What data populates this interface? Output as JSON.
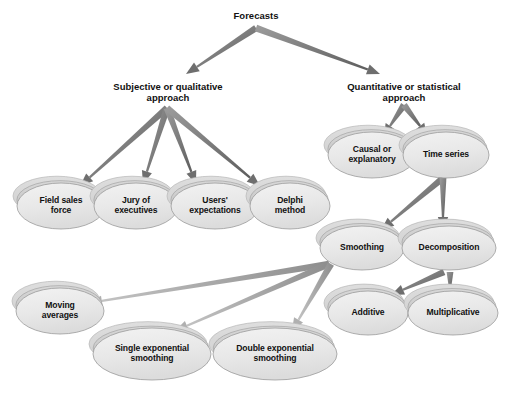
{
  "diagram": {
    "background_color": "#ffffff",
    "palette": {
      "ellipse_face": "#e6e6e6",
      "ellipse_face_edge": "#9a9a9a",
      "ellipse_top_shadow": "#c9c9c9",
      "ellipse_back_shadow": "#d4d4d4",
      "ellipse_dark_wedge": "#8c8c8c",
      "arrow_dark": "#6e6e6e",
      "arrow_light": "#b0b0b0",
      "text_color": "#111111"
    },
    "plain_nodes": [
      {
        "id": "forecasts",
        "label": "Forecasts",
        "cx": 256,
        "cy": 17,
        "font_size": 9.5
      },
      {
        "id": "subjective",
        "label": "Subjective or qualitative\napproach",
        "cx": 168,
        "cy": 88,
        "font_size": 9.5
      },
      {
        "id": "quantitative",
        "label": "Quantitative or statistical\napproach",
        "cx": 404,
        "cy": 88,
        "font_size": 9.5
      }
    ],
    "ellipse_nodes": [
      {
        "id": "field-sales-force",
        "label": "Field sales\nforce",
        "cx": 61,
        "cy": 206,
        "rx": 44,
        "ry": 23,
        "font_size": 8.6
      },
      {
        "id": "jury-of-executives",
        "label": "Jury of\nexecutives",
        "cx": 136,
        "cy": 206,
        "rx": 42,
        "ry": 23,
        "font_size": 8.6
      },
      {
        "id": "users-expectations",
        "label": "Users'\nexpectations",
        "cx": 215,
        "cy": 206,
        "rx": 44,
        "ry": 23,
        "font_size": 8.6
      },
      {
        "id": "delphi-method",
        "label": "Delphi\nmethod",
        "cx": 290,
        "cy": 206,
        "rx": 40,
        "ry": 23,
        "font_size": 8.6
      },
      {
        "id": "causal-or-explanatory",
        "label": "Causal or\nexplanatory",
        "cx": 372,
        "cy": 155,
        "rx": 44,
        "ry": 23,
        "font_size": 8.6
      },
      {
        "id": "time-series",
        "label": "Time series",
        "cx": 446,
        "cy": 155,
        "rx": 43,
        "ry": 23,
        "font_size": 8.6
      },
      {
        "id": "smoothing",
        "label": "Smoothing",
        "cx": 362,
        "cy": 248,
        "rx": 42,
        "ry": 22,
        "font_size": 8.6
      },
      {
        "id": "decomposition",
        "label": "Decomposition",
        "cx": 449,
        "cy": 248,
        "rx": 47,
        "ry": 22,
        "font_size": 8.6
      },
      {
        "id": "additive",
        "label": "Additive",
        "cx": 368,
        "cy": 313,
        "rx": 40,
        "ry": 22,
        "font_size": 8.6
      },
      {
        "id": "multiplicative",
        "label": "Multiplicative",
        "cx": 453,
        "cy": 313,
        "rx": 45,
        "ry": 22,
        "font_size": 8.6
      },
      {
        "id": "moving-averages",
        "label": "Moving\naverages",
        "cx": 60,
        "cy": 311,
        "rx": 44,
        "ry": 23,
        "font_size": 8.6
      },
      {
        "id": "single-exponential-smoothing",
        "label": "Single exponential\nsmoothing",
        "cx": 152,
        "cy": 354,
        "rx": 59,
        "ry": 26,
        "font_size": 8.6
      },
      {
        "id": "double-exponential-smoothing",
        "label": "Double exponential\nsmoothing",
        "cx": 275,
        "cy": 354,
        "rx": 62,
        "ry": 26,
        "font_size": 8.6
      }
    ],
    "edges": [
      {
        "from": "forecasts",
        "to": "subjective",
        "x1": 256,
        "y1": 28,
        "x2": 186,
        "y2": 74,
        "style": "dark"
      },
      {
        "from": "forecasts",
        "to": "quantitative",
        "x1": 256,
        "y1": 28,
        "x2": 380,
        "y2": 74,
        "style": "dark"
      },
      {
        "from": "subjective",
        "to": "field-sales-force",
        "x1": 167,
        "y1": 108,
        "x2": 80,
        "y2": 186,
        "style": "dark"
      },
      {
        "from": "subjective",
        "to": "jury-of-executives",
        "x1": 167,
        "y1": 108,
        "x2": 143,
        "y2": 184,
        "style": "dark"
      },
      {
        "from": "subjective",
        "to": "users-expectations",
        "x1": 167,
        "y1": 108,
        "x2": 196,
        "y2": 184,
        "style": "dark"
      },
      {
        "from": "subjective",
        "to": "delphi-method",
        "x1": 167,
        "y1": 108,
        "x2": 260,
        "y2": 186,
        "style": "dark"
      },
      {
        "from": "quantitative",
        "to": "causal-or-explanatory",
        "x1": 404,
        "y1": 105,
        "x2": 384,
        "y2": 135,
        "style": "dark"
      },
      {
        "from": "quantitative",
        "to": "time-series",
        "x1": 404,
        "y1": 105,
        "x2": 427,
        "y2": 135,
        "style": "dark"
      },
      {
        "from": "time-series",
        "to": "smoothing",
        "x1": 443,
        "y1": 178,
        "x2": 381,
        "y2": 230,
        "style": "dark"
      },
      {
        "from": "time-series",
        "to": "decomposition",
        "x1": 443,
        "y1": 178,
        "x2": 443,
        "y2": 230,
        "style": "dark"
      },
      {
        "from": "decomposition",
        "to": "additive",
        "x1": 444,
        "y1": 272,
        "x2": 391,
        "y2": 295,
        "style": "dark"
      },
      {
        "from": "decomposition",
        "to": "multiplicative",
        "x1": 450,
        "y1": 272,
        "x2": 450,
        "y2": 295,
        "style": "dark"
      },
      {
        "from": "smoothing",
        "to": "moving-averages",
        "x1": 329,
        "y1": 264,
        "x2": 89,
        "y2": 303,
        "style": "light"
      },
      {
        "from": "smoothing",
        "to": "single-exponential-smoothing",
        "x1": 329,
        "y1": 264,
        "x2": 175,
        "y2": 331,
        "style": "light"
      },
      {
        "from": "smoothing",
        "to": "double-exponential-smoothing",
        "x1": 331,
        "y1": 264,
        "x2": 292,
        "y2": 331,
        "style": "light"
      }
    ]
  }
}
